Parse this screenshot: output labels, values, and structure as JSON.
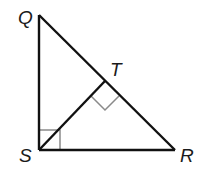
{
  "diagram": {
    "type": "right-triangle-with-altitude",
    "vertices": {
      "Q": {
        "label": "Q",
        "x": 39,
        "y": 15
      },
      "S": {
        "label": "S",
        "x": 39,
        "y": 150
      },
      "R": {
        "label": "R",
        "x": 175,
        "y": 150
      },
      "T": {
        "label": "T",
        "x": 105,
        "y": 81
      }
    },
    "segments": [
      "QS",
      "SR",
      "QR",
      "ST"
    ],
    "right_angles": [
      "QSR",
      "STR"
    ],
    "colors": {
      "line": "#111111",
      "right_angle_marker": "#8a8a8a",
      "label": "#1a1a1a"
    }
  }
}
